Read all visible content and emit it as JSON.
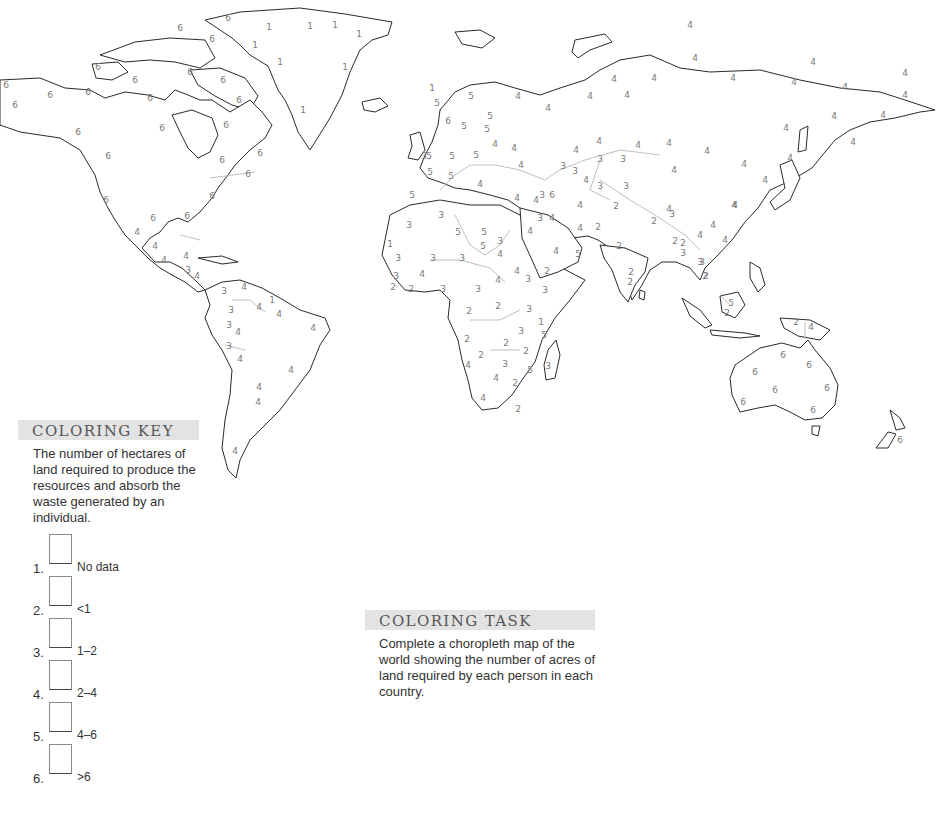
{
  "coloring_key": {
    "title": "COLORING KEY",
    "description": "The number of hectares of land required to produce the resources and absorb the waste generated by an individual.",
    "items": [
      {
        "number": "1.",
        "label": "No data"
      },
      {
        "number": "2.",
        "label": "<1"
      },
      {
        "number": "3.",
        "label": "1–2"
      },
      {
        "number": "4.",
        "label": "2–4"
      },
      {
        "number": "5.",
        "label": "4–6"
      },
      {
        "number": "6.",
        "label": ">6"
      }
    ]
  },
  "coloring_task": {
    "title": "COLORING TASK",
    "description": "Complete a choropleth map of the world showing the number of acres of land required by each person in each country."
  },
  "map": {
    "type": "world choropleth coloring outline",
    "colors": {
      "coastline": "#2a2a2a",
      "border": "#b8b8b8",
      "label": "#7a7a7a",
      "header_bg": "#e3e3e3"
    },
    "labels": [
      {
        "v": "6",
        "x": 6,
        "y": 85
      },
      {
        "v": "6",
        "x": 50,
        "y": 95
      },
      {
        "v": "6",
        "x": 88,
        "y": 92
      },
      {
        "v": "6",
        "x": 15,
        "y": 105
      },
      {
        "v": "6",
        "x": 78,
        "y": 132
      },
      {
        "v": "6",
        "x": 108,
        "y": 156
      },
      {
        "v": "6",
        "x": 228,
        "y": 18
      },
      {
        "v": "6",
        "x": 180,
        "y": 28
      },
      {
        "v": "6",
        "x": 212,
        "y": 39
      },
      {
        "v": "6",
        "x": 98,
        "y": 67
      },
      {
        "v": "6",
        "x": 135,
        "y": 80
      },
      {
        "v": "6",
        "x": 150,
        "y": 98
      },
      {
        "v": "6",
        "x": 190,
        "y": 72
      },
      {
        "v": "6",
        "x": 162,
        "y": 128
      },
      {
        "v": "6",
        "x": 223,
        "y": 80
      },
      {
        "v": "6",
        "x": 239,
        "y": 100
      },
      {
        "v": "6",
        "x": 226,
        "y": 125
      },
      {
        "v": "6",
        "x": 222,
        "y": 160
      },
      {
        "v": "6",
        "x": 260,
        "y": 153
      },
      {
        "v": "6",
        "x": 248,
        "y": 174
      },
      {
        "v": "6",
        "x": 212,
        "y": 196
      },
      {
        "v": "6",
        "x": 106,
        "y": 200
      },
      {
        "v": "6",
        "x": 153,
        "y": 218
      },
      {
        "v": "6",
        "x": 187,
        "y": 216
      },
      {
        "v": "1",
        "x": 269,
        "y": 27
      },
      {
        "v": "1",
        "x": 310,
        "y": 26
      },
      {
        "v": "1",
        "x": 255,
        "y": 45
      },
      {
        "v": "1",
        "x": 280,
        "y": 62
      },
      {
        "v": "1",
        "x": 303,
        "y": 110
      },
      {
        "v": "1",
        "x": 335,
        "y": 25
      },
      {
        "v": "1",
        "x": 359,
        "y": 34
      },
      {
        "v": "1",
        "x": 345,
        "y": 67
      },
      {
        "v": "1",
        "x": 432,
        "y": 88
      },
      {
        "v": "4",
        "x": 137,
        "y": 232
      },
      {
        "v": "4",
        "x": 155,
        "y": 246
      },
      {
        "v": "4",
        "x": 164,
        "y": 260
      },
      {
        "v": "4",
        "x": 186,
        "y": 256
      },
      {
        "v": "3",
        "x": 188,
        "y": 270
      },
      {
        "v": "4",
        "x": 197,
        "y": 276
      },
      {
        "v": "3",
        "x": 224,
        "y": 291
      },
      {
        "v": "4",
        "x": 244,
        "y": 287
      },
      {
        "v": "1",
        "x": 272,
        "y": 300
      },
      {
        "v": "3",
        "x": 231,
        "y": 310
      },
      {
        "v": "4",
        "x": 259,
        "y": 307
      },
      {
        "v": "4",
        "x": 279,
        "y": 314
      },
      {
        "v": "3",
        "x": 229,
        "y": 325
      },
      {
        "v": "4",
        "x": 238,
        "y": 332
      },
      {
        "v": "4",
        "x": 313,
        "y": 328
      },
      {
        "v": "3",
        "x": 229,
        "y": 346
      },
      {
        "v": "4",
        "x": 240,
        "y": 359
      },
      {
        "v": "4",
        "x": 291,
        "y": 370
      },
      {
        "v": "4",
        "x": 258,
        "y": 402
      },
      {
        "v": "4",
        "x": 259,
        "y": 387
      },
      {
        "v": "4",
        "x": 235,
        "y": 451
      },
      {
        "v": "5",
        "x": 471,
        "y": 96
      },
      {
        "v": "4",
        "x": 518,
        "y": 96
      },
      {
        "v": "5",
        "x": 437,
        "y": 103
      },
      {
        "v": "4",
        "x": 548,
        "y": 108
      },
      {
        "v": "5",
        "x": 490,
        "y": 116
      },
      {
        "v": "4",
        "x": 590,
        "y": 96
      },
      {
        "v": "4",
        "x": 614,
        "y": 79
      },
      {
        "v": "4",
        "x": 654,
        "y": 78
      },
      {
        "v": "6",
        "x": 448,
        "y": 121
      },
      {
        "v": "5",
        "x": 464,
        "y": 126
      },
      {
        "v": "5",
        "x": 487,
        "y": 129
      },
      {
        "v": "4",
        "x": 495,
        "y": 144
      },
      {
        "v": "4",
        "x": 514,
        "y": 148
      },
      {
        "v": "4",
        "x": 599,
        "y": 141
      },
      {
        "v": "4",
        "x": 638,
        "y": 145
      },
      {
        "v": "4",
        "x": 576,
        "y": 150
      },
      {
        "v": "4",
        "x": 669,
        "y": 143
      },
      {
        "v": "4",
        "x": 707,
        "y": 151
      },
      {
        "v": "3",
        "x": 424,
        "y": 156
      },
      {
        "v": "5",
        "x": 429,
        "y": 156
      },
      {
        "v": "5",
        "x": 452,
        "y": 156
      },
      {
        "v": "5",
        "x": 476,
        "y": 155
      },
      {
        "v": "3",
        "x": 563,
        "y": 166
      },
      {
        "v": "3",
        "x": 600,
        "y": 159
      },
      {
        "v": "3",
        "x": 623,
        "y": 159
      },
      {
        "v": "5",
        "x": 430,
        "y": 172
      },
      {
        "v": "4",
        "x": 521,
        "y": 165
      },
      {
        "v": "3",
        "x": 575,
        "y": 171
      },
      {
        "v": "4",
        "x": 586,
        "y": 180
      },
      {
        "v": "5",
        "x": 451,
        "y": 176
      },
      {
        "v": "4",
        "x": 480,
        "y": 184
      },
      {
        "v": "3",
        "x": 600,
        "y": 186
      },
      {
        "v": "3",
        "x": 626,
        "y": 186
      },
      {
        "v": "4",
        "x": 674,
        "y": 170
      },
      {
        "v": "4",
        "x": 744,
        "y": 164
      },
      {
        "v": "5",
        "x": 412,
        "y": 195
      },
      {
        "v": "4",
        "x": 517,
        "y": 198
      },
      {
        "v": "4",
        "x": 536,
        "y": 200
      },
      {
        "v": "3",
        "x": 542,
        "y": 195
      },
      {
        "v": "6",
        "x": 552,
        "y": 195
      },
      {
        "v": "4",
        "x": 580,
        "y": 205
      },
      {
        "v": "2",
        "x": 616,
        "y": 206
      },
      {
        "v": "4",
        "x": 669,
        "y": 209
      },
      {
        "v": "3",
        "x": 441,
        "y": 215
      },
      {
        "v": "3",
        "x": 409,
        "y": 225
      },
      {
        "v": "3",
        "x": 540,
        "y": 218
      },
      {
        "v": "4",
        "x": 552,
        "y": 218
      },
      {
        "v": "4",
        "x": 580,
        "y": 228
      },
      {
        "v": "2",
        "x": 598,
        "y": 227
      },
      {
        "v": "2",
        "x": 654,
        "y": 221
      },
      {
        "v": "3",
        "x": 672,
        "y": 214
      },
      {
        "v": "4",
        "x": 713,
        "y": 225
      },
      {
        "v": "4",
        "x": 735,
        "y": 205
      },
      {
        "v": "5",
        "x": 458,
        "y": 232
      },
      {
        "v": "5",
        "x": 484,
        "y": 232
      },
      {
        "v": "3",
        "x": 500,
        "y": 241
      },
      {
        "v": "4",
        "x": 530,
        "y": 231
      },
      {
        "v": "5",
        "x": 483,
        "y": 246
      },
      {
        "v": "4",
        "x": 500,
        "y": 254
      },
      {
        "v": "5",
        "x": 578,
        "y": 254
      },
      {
        "v": "4",
        "x": 556,
        "y": 251
      },
      {
        "v": "2",
        "x": 619,
        "y": 246
      },
      {
        "v": "2",
        "x": 675,
        "y": 241
      },
      {
        "v": "4",
        "x": 700,
        "y": 235
      },
      {
        "v": "4",
        "x": 725,
        "y": 240
      },
      {
        "v": "1",
        "x": 390,
        "y": 244
      },
      {
        "v": "3",
        "x": 398,
        "y": 258
      },
      {
        "v": "3",
        "x": 433,
        "y": 258
      },
      {
        "v": "3",
        "x": 462,
        "y": 258
      },
      {
        "v": "2",
        "x": 547,
        "y": 271
      },
      {
        "v": "2",
        "x": 683,
        "y": 243
      },
      {
        "v": "3",
        "x": 683,
        "y": 253
      },
      {
        "v": "3",
        "x": 700,
        "y": 262
      },
      {
        "v": "2",
        "x": 706,
        "y": 276
      },
      {
        "v": "2",
        "x": 631,
        "y": 272
      },
      {
        "v": "3",
        "x": 396,
        "y": 276
      },
      {
        "v": "4",
        "x": 422,
        "y": 274
      },
      {
        "v": "2",
        "x": 393,
        "y": 287
      },
      {
        "v": "2",
        "x": 411,
        "y": 289
      },
      {
        "v": "3",
        "x": 443,
        "y": 289
      },
      {
        "v": "3",
        "x": 478,
        "y": 289
      },
      {
        "v": "4",
        "x": 498,
        "y": 280
      },
      {
        "v": "4",
        "x": 517,
        "y": 271
      },
      {
        "v": "3",
        "x": 528,
        "y": 279
      },
      {
        "v": "3",
        "x": 545,
        "y": 290
      },
      {
        "v": "2",
        "x": 498,
        "y": 306
      },
      {
        "v": "2",
        "x": 469,
        "y": 311
      },
      {
        "v": "3",
        "x": 529,
        "y": 309
      },
      {
        "v": "1",
        "x": 541,
        "y": 322
      },
      {
        "v": "3",
        "x": 521,
        "y": 331
      },
      {
        "v": "5",
        "x": 544,
        "y": 335
      },
      {
        "v": "2",
        "x": 506,
        "y": 343
      },
      {
        "v": "2",
        "x": 526,
        "y": 351
      },
      {
        "v": "2",
        "x": 467,
        "y": 339
      },
      {
        "v": "2",
        "x": 481,
        "y": 355
      },
      {
        "v": "4",
        "x": 468,
        "y": 365
      },
      {
        "v": "3",
        "x": 505,
        "y": 364
      },
      {
        "v": "5",
        "x": 530,
        "y": 370
      },
      {
        "v": "3",
        "x": 548,
        "y": 366
      },
      {
        "v": "4",
        "x": 496,
        "y": 378
      },
      {
        "v": "2",
        "x": 515,
        "y": 383
      },
      {
        "v": "4",
        "x": 483,
        "y": 398
      },
      {
        "v": "2",
        "x": 518,
        "y": 409
      },
      {
        "v": "2",
        "x": 630,
        "y": 282
      },
      {
        "v": "3",
        "x": 702,
        "y": 262
      },
      {
        "v": "2",
        "x": 705,
        "y": 276
      },
      {
        "v": "5",
        "x": 731,
        "y": 303
      },
      {
        "v": "2",
        "x": 727,
        "y": 313
      },
      {
        "v": "2",
        "x": 796,
        "y": 322
      },
      {
        "v": "4",
        "x": 811,
        "y": 327
      },
      {
        "v": "6",
        "x": 783,
        "y": 355
      },
      {
        "v": "6",
        "x": 809,
        "y": 365
      },
      {
        "v": "6",
        "x": 755,
        "y": 372
      },
      {
        "v": "6",
        "x": 775,
        "y": 390
      },
      {
        "v": "6",
        "x": 827,
        "y": 388
      },
      {
        "v": "6",
        "x": 743,
        "y": 402
      },
      {
        "v": "6",
        "x": 813,
        "y": 410
      },
      {
        "v": "6",
        "x": 900,
        "y": 440
      },
      {
        "v": "4",
        "x": 690,
        "y": 25
      },
      {
        "v": "4",
        "x": 695,
        "y": 58
      },
      {
        "v": "4",
        "x": 733,
        "y": 78
      },
      {
        "v": "4",
        "x": 813,
        "y": 62
      },
      {
        "v": "4",
        "x": 794,
        "y": 82
      },
      {
        "v": "4",
        "x": 905,
        "y": 73
      },
      {
        "v": "4",
        "x": 845,
        "y": 87
      },
      {
        "v": "4",
        "x": 627,
        "y": 95
      },
      {
        "v": "4",
        "x": 905,
        "y": 95
      },
      {
        "v": "4",
        "x": 834,
        "y": 116
      },
      {
        "v": "4",
        "x": 883,
        "y": 115
      },
      {
        "v": "4",
        "x": 786,
        "y": 128
      },
      {
        "v": "4",
        "x": 853,
        "y": 142
      },
      {
        "v": "4",
        "x": 790,
        "y": 158
      },
      {
        "v": "4",
        "x": 765,
        "y": 180
      },
      {
        "v": "4",
        "x": 734,
        "y": 205
      }
    ]
  }
}
